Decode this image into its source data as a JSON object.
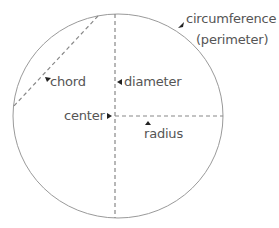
{
  "diagram": {
    "type": "circle-anatomy",
    "colors": {
      "outline": "#999999",
      "dashed": "#888888",
      "arrow": "#222222",
      "text": "#555555"
    },
    "labels": {
      "circumference": "circumference",
      "perimeter": "(perimeter)",
      "chord": "chord",
      "diameter": "diameter",
      "center": "center",
      "radius": "radius"
    }
  }
}
